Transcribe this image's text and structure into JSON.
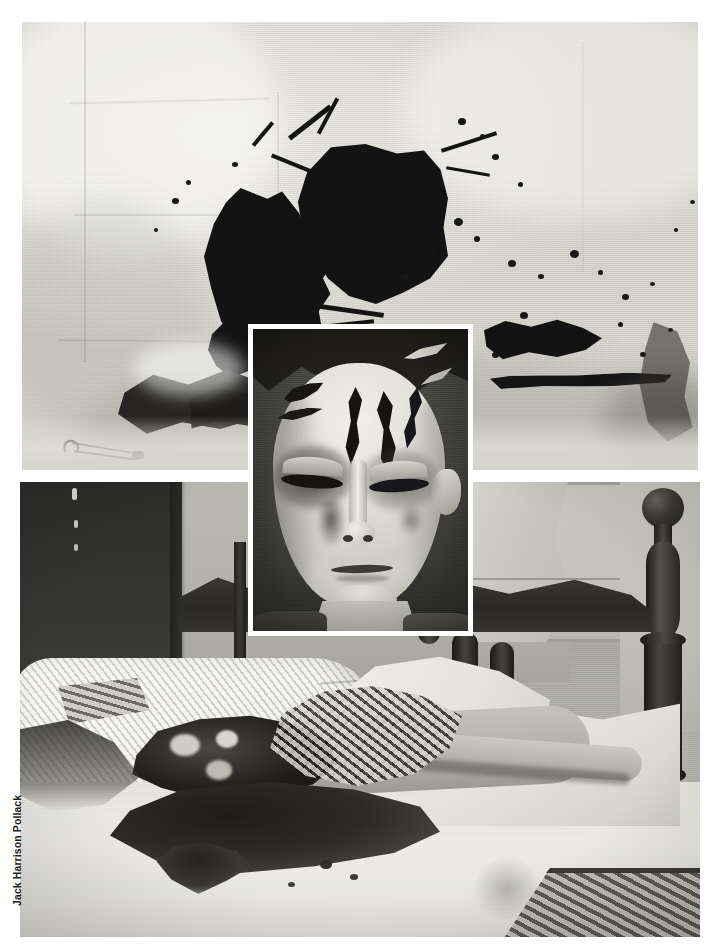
{
  "page": {
    "background_color": "#ffffff",
    "width": 720,
    "height": 951,
    "kind": "printed-book-page-photo-plate"
  },
  "credit": {
    "text": "Jack Harrison Pollack",
    "orientation": "vertical-bottom-up",
    "color": "#1c1c1c"
  },
  "photos": [
    {
      "id": "photo-top",
      "name": "bloodstained-bedsheet-photo",
      "caption": "",
      "subject": "Crumpled white bed sheet bearing two large dark bloodstains and surrounding spatter",
      "tone": "black-and-white",
      "frame": {
        "x": 22,
        "y": 22,
        "width": 676,
        "height": 448
      },
      "elements": [
        "large central blood blot",
        "second smaller blood blot to the left",
        "fine spatter droplets",
        "horizontal dark smear across lower third",
        "open safety pin at lower left",
        "vertical fabric creases"
      ]
    },
    {
      "id": "photo-inset",
      "name": "victim-face-closeup-inset",
      "caption": "",
      "subject": "Close-up of a face with dark hair and several deep dark gash wounds across the forehead and bruised eyes",
      "tone": "black-and-white",
      "border_color": "#ffffff",
      "frame": {
        "x": 248,
        "y": 324,
        "width": 225,
        "height": 312
      },
      "elements": [
        "dark hair",
        "four dark forehead gashes",
        "bruised closed eyes",
        "nose",
        "closed mouth",
        "chin and neck"
      ]
    },
    {
      "id": "photo-bottom",
      "name": "crime-scene-bed-photo",
      "caption": "",
      "subject": "Bedroom crime scene: body lying on a bed with white pillow and sheets, dark blood pooling, wooden bed post and headboard",
      "tone": "black-and-white",
      "frame": {
        "x": 20,
        "y": 482,
        "width": 680,
        "height": 455
      },
      "elements": [
        "dark wooden headboard at left",
        "turned wooden bedpost with ball finial at right",
        "white chenille pillow",
        "white rumpled sheet",
        "body with severe head wounds",
        "large dark blood pool on sheet",
        "wooden bed rail at bottom right",
        "window and light wall in background"
      ]
    }
  ]
}
